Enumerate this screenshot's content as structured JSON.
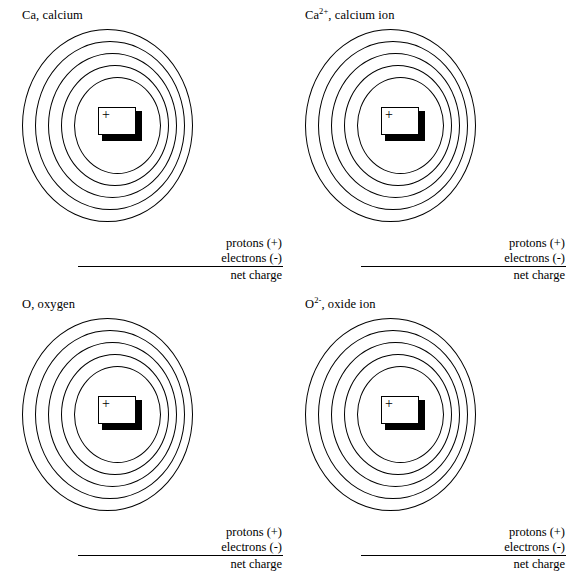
{
  "worksheet": {
    "title": "Bohr model atom / ion worksheet",
    "shell_count": 5,
    "nucleus_symbol": "+",
    "ink_color": "#000000",
    "paper_color": "#ffffff"
  },
  "blank_rows": {
    "protons": "protons (+)",
    "electrons": "electrons (-)",
    "net_charge": "net charge"
  },
  "panels": [
    {
      "id": "calcium-atom",
      "label_main": "Ca",
      "label_superscript": "",
      "label_rest": ", calcium",
      "label_full": "Ca, calcium"
    },
    {
      "id": "calcium-ion",
      "label_main": "Ca",
      "label_superscript": "2+",
      "label_rest": ", calcium ion",
      "label_full": "Ca2+, calcium ion"
    },
    {
      "id": "oxygen-atom",
      "label_main": "O",
      "label_superscript": "",
      "label_rest": ", oxygen",
      "label_full": "O, oxygen"
    },
    {
      "id": "oxide-ion",
      "label_main": "O",
      "label_superscript": "2-",
      "label_rest": ", oxide ion",
      "label_full": "O2-, oxide ion"
    }
  ]
}
